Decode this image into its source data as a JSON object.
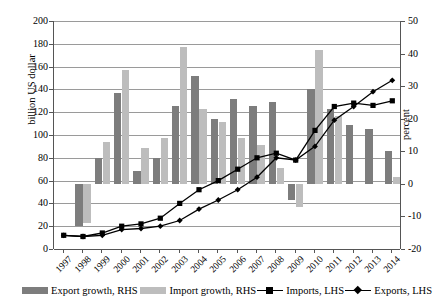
{
  "chart_data": {
    "type": "bar",
    "title": "",
    "xlabel": "",
    "ylabel": "billion US dollar",
    "y2label": "percent",
    "ylim": [
      0,
      200
    ],
    "y2lim": [
      -20,
      50
    ],
    "ytick_step": 20,
    "y2tick_step": 10,
    "grid": true,
    "legend_position": "bottom",
    "categories": [
      "1997",
      "1998",
      "1999",
      "2000",
      "2001",
      "2002",
      "2003",
      "2004",
      "2005",
      "2006",
      "2007",
      "2008",
      "2009",
      "2010",
      "2011",
      "2012",
      "2013",
      "2014"
    ],
    "series": [
      {
        "name": "Export growth, RHS",
        "type": "bar",
        "axis": "right",
        "unit": "percent",
        "color": "#7d7d7d",
        "values": [
          null,
          -13,
          8,
          28,
          4,
          8,
          24,
          33,
          20,
          26,
          24,
          25,
          -5,
          29,
          23,
          18,
          17,
          10
        ]
      },
      {
        "name": "Import growth, RHS",
        "type": "bar",
        "axis": "right",
        "unit": "percent",
        "color": "#bdbdbd",
        "values": [
          null,
          -12,
          13,
          35,
          11,
          14,
          42,
          23,
          19,
          14,
          12,
          5,
          -7,
          41,
          21,
          0,
          0,
          2
        ]
      },
      {
        "name": "Imports, LHS",
        "type": "line",
        "axis": "left",
        "unit": "billion US dollar",
        "marker": "square",
        "color": "#000000",
        "values": [
          12,
          11,
          14,
          20,
          22,
          27,
          40,
          52,
          60,
          70,
          80,
          84,
          78,
          104,
          125,
          128,
          126,
          130
        ]
      },
      {
        "name": "Exports, LHS",
        "type": "line",
        "axis": "left",
        "unit": "billion US dollar",
        "marker": "diamond",
        "color": "#000000",
        "values": [
          12,
          11,
          12,
          17,
          18,
          20,
          25,
          35,
          43,
          52,
          63,
          80,
          78,
          90,
          113,
          125,
          138,
          148
        ]
      }
    ],
    "ytick_labels": [
      "0",
      "20",
      "40",
      "60",
      "80",
      "100",
      "120",
      "140",
      "160",
      "180",
      "200"
    ],
    "y2tick_labels": [
      "-20",
      "-10",
      "0",
      "10",
      "20",
      "30",
      "40",
      "50"
    ]
  },
  "legend": {
    "items": [
      {
        "label": "Export growth, RHS",
        "swatch": "bar-dark"
      },
      {
        "label": "Import growth, RHS",
        "swatch": "bar-light"
      },
      {
        "label": "Imports, LHS",
        "swatch": "line-square"
      },
      {
        "label": "Exports, LHS",
        "swatch": "line-diamond"
      }
    ]
  }
}
